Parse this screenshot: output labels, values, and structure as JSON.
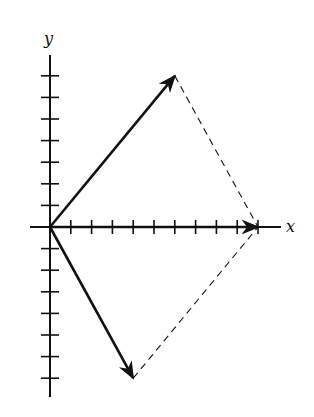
{
  "figure": {
    "type": "vector-addition-diagram",
    "axes": {
      "x_label": "x",
      "y_label": "y",
      "x_ticks_positive": 10,
      "y_ticks_positive": 7,
      "y_ticks_negative": 7
    },
    "vectors": [
      {
        "name": "A",
        "from": [
          0,
          0
        ],
        "to": [
          6,
          7
        ],
        "style": "solid-arrow"
      },
      {
        "name": "B",
        "from": [
          0,
          0
        ],
        "to": [
          4,
          -7
        ],
        "style": "solid-arrow"
      },
      {
        "name": "A+B",
        "from": [
          0,
          0
        ],
        "to": [
          10,
          0
        ],
        "style": "solid-arrow"
      }
    ],
    "construction_lines": [
      {
        "from": [
          6,
          7
        ],
        "to": [
          10,
          0
        ],
        "style": "dashed"
      },
      {
        "from": [
          4,
          -7
        ],
        "to": [
          10,
          0
        ],
        "style": "dashed"
      }
    ],
    "colors": {
      "ink": "#111111",
      "background": "#ffffff"
    }
  }
}
